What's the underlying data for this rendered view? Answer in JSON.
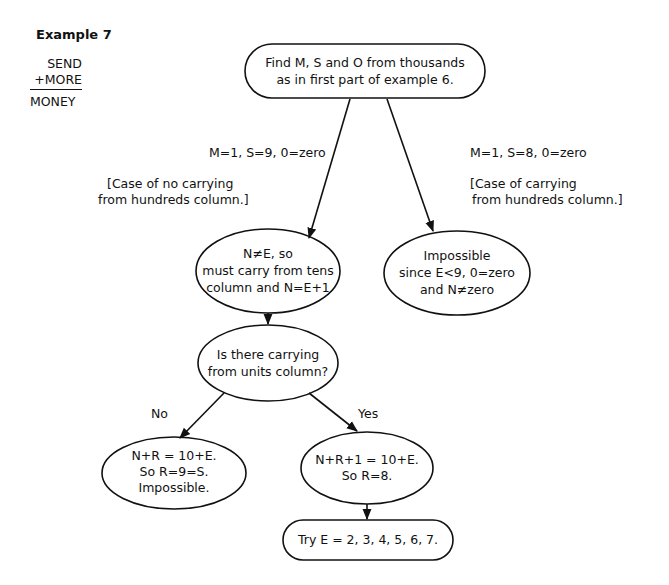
{
  "example": {
    "title": "Example 7",
    "puzzle": {
      "line1": "SEND",
      "line2": "+MORE",
      "line3": "MONEY"
    }
  },
  "nodes": {
    "start": {
      "shape": "pill",
      "line1": "Find M, S and O from thousands",
      "line2": "as in first part of example 6."
    },
    "no_carry_hundreds": {
      "shape": "ellipse",
      "line1": "N≠E, so",
      "line2": "must carry from tens",
      "line3": "column and N=E+1"
    },
    "carry_hundreds": {
      "shape": "ellipse",
      "line1": "Impossible",
      "line2": "since E<9, 0=zero",
      "line3": "and N≠zero"
    },
    "question": {
      "shape": "ellipse",
      "line1": "Is there carrying",
      "line2": "from units column?"
    },
    "no_branch": {
      "shape": "ellipse",
      "line1": "N+R = 10+E.",
      "line2": "So R=9=S.",
      "line3": "Impossible."
    },
    "yes_branch": {
      "shape": "ellipse",
      "line1": "N+R+1 = 10+E.",
      "line2": "So R=8."
    },
    "final": {
      "shape": "pill",
      "line1": "Try E = 2, 3, 4, 5, 6, 7."
    }
  },
  "edges": {
    "left": {
      "label": "M=1, S=9, 0=zero",
      "note_line1": "[Case of no carrying",
      "note_line2": "from hundreds column.]"
    },
    "right": {
      "label": "M=1, S=8, 0=zero",
      "note_line1": "[Case of carrying",
      "note_line2": "from hundreds column.]"
    },
    "no": {
      "label": "No"
    },
    "yes": {
      "label": "Yes"
    }
  },
  "colors": {
    "stroke": "#111111",
    "background": "#ffffff"
  }
}
